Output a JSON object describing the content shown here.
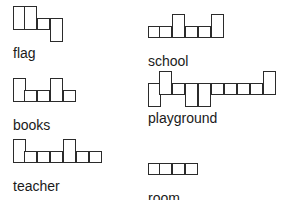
{
  "worksheet": {
    "title": "Word Shape Boxes",
    "background_color": "#ffffff",
    "outline_color": "#2b2b2b",
    "text_color": "#1a1a1a",
    "columns": 2,
    "rows": 3,
    "items": [
      {
        "word": "flag",
        "letters": [
          "f",
          "l",
          "a",
          "g"
        ],
        "box_count": 4,
        "shapes": [
          "tall",
          "tall",
          "short",
          "desc"
        ],
        "position": "row1-col1"
      },
      {
        "word": "school",
        "letters": [
          "s",
          "c",
          "h",
          "o",
          "o",
          "l"
        ],
        "box_count": 6,
        "shapes": [
          "short",
          "short",
          "tall",
          "short",
          "short",
          "tall"
        ],
        "position": "row1-col2"
      },
      {
        "word": "books",
        "letters": [
          "b",
          "o",
          "o",
          "k",
          "s"
        ],
        "box_count": 5,
        "shapes": [
          "tall",
          "short",
          "short",
          "tall",
          "short"
        ],
        "position": "row2-col1"
      },
      {
        "word": "playground",
        "letters": [
          "p",
          "l",
          "a",
          "y",
          "g",
          "r",
          "o",
          "u",
          "n",
          "d"
        ],
        "box_count": 10,
        "shapes": [
          "desc",
          "tall",
          "short",
          "desc",
          "desc",
          "short",
          "short",
          "short",
          "short",
          "tall"
        ],
        "position": "row2-col2"
      },
      {
        "word": "teacher",
        "letters": [
          "t",
          "e",
          "a",
          "c",
          "h",
          "e",
          "r"
        ],
        "box_count": 7,
        "shapes": [
          "tall",
          "short",
          "short",
          "short",
          "tall",
          "short",
          "short"
        ],
        "position": "row3-col1"
      },
      {
        "word": "room",
        "letters": [
          "r",
          "o",
          "o",
          "m"
        ],
        "box_count": 4,
        "shapes": [
          "short",
          "short",
          "short",
          "short"
        ],
        "position": "row3-col2"
      }
    ],
    "legend": {
      "tall": "ascender letter (box extends above x-height)",
      "short": "x-height letter (box in middle band only)",
      "desc": "descender letter (box extends below x-height)"
    }
  }
}
